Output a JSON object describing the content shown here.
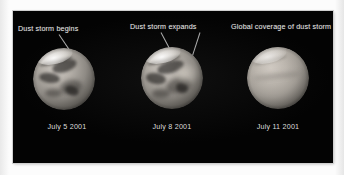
{
  "figure": {
    "background_color": "#fdfdfd",
    "panel_color": "#030303",
    "text_color": "#e3e3e3",
    "leader_line_color": "#c9c9c9"
  },
  "panels": [
    {
      "id": "panel-july-5",
      "annotation": "Dust storm begins",
      "caption": "July 5 2001",
      "subject": "mars-globe",
      "appearance": "sharp surface albedo features visible, bright north polar hood",
      "leader_lines": 1
    },
    {
      "id": "panel-july-8",
      "annotation": "Dust storm expands",
      "caption": "July 8 2001",
      "subject": "mars-globe",
      "appearance": "surface features still visible, bright dust region enlarging near limb",
      "leader_lines": 2
    },
    {
      "id": "panel-july-11",
      "annotation": "Global coverage of dust storm",
      "caption": "July 11 2001",
      "subject": "mars-globe",
      "appearance": "surface obscured by uniform tan dust haze, featureless disc",
      "leader_lines": 0
    }
  ]
}
